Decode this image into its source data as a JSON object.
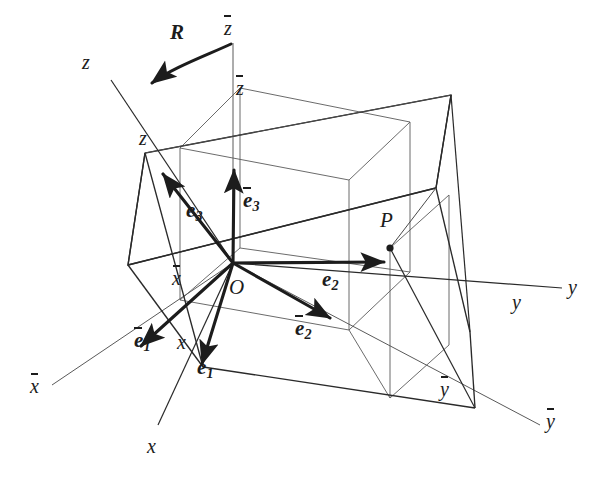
{
  "figure": {
    "type": "3d-coordinate-rotation-diagram",
    "width": 601,
    "height": 483,
    "background": "#ffffff",
    "ink": "#1c1c1c",
    "thin_ink": "#555555"
  },
  "labels": {
    "rotation": "R",
    "origin": "O",
    "point": "P",
    "axis_z_tip": "z",
    "axis_z_corner": "z",
    "axis_zbar_tip": "z",
    "axis_zbar_corner": "z",
    "axis_x_tip": "x",
    "axis_x_corner": "x",
    "axis_xbar_tip": "x",
    "axis_xbar_corner": "x",
    "axis_y_tip": "y",
    "axis_y_corner": "y",
    "axis_ybar_tip": "y",
    "axis_ybar_corner": "y",
    "basis_e1": "e",
    "basis_e2": "e",
    "basis_e3": "e",
    "basis_e1bar": "e",
    "basis_e2bar": "e",
    "basis_e3bar": "e",
    "sub_1": "1",
    "sub_2": "2",
    "sub_3": "3"
  },
  "geometry": {
    "origin": [
      233,
      263
    ],
    "point_P": [
      390,
      248
    ],
    "axis_tips": {
      "z": [
        105,
        72
      ],
      "zbar": [
        233,
        30
      ],
      "x": [
        152,
        432
      ],
      "xbar": [
        42,
        392
      ],
      "y": [
        570,
        292
      ],
      "ybar": [
        548,
        432
      ]
    },
    "basis_vector_tips": {
      "e1": [
        203,
        367
      ],
      "e2": [
        385,
        262
      ],
      "e3": [
        162,
        172
      ],
      "e1bar": [
        140,
        348
      ],
      "e2bar": [
        330,
        320
      ],
      "e3bar": [
        234,
        168
      ]
    }
  }
}
